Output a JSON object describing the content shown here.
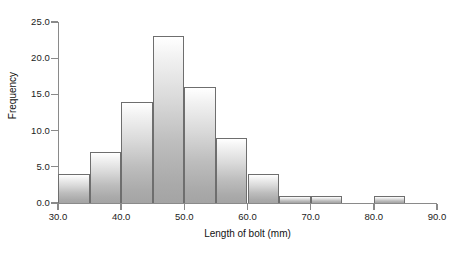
{
  "chart_data": {
    "type": "bar",
    "title": "",
    "subtitle": "",
    "xlabel": "Length of bolt (mm)",
    "ylabel": "Frequency",
    "xlim": [
      30,
      90
    ],
    "ylim": [
      0,
      25
    ],
    "grid": false,
    "legend": "none",
    "bin_width": 5,
    "bin_edges": [
      30,
      35,
      40,
      45,
      50,
      55,
      60,
      65,
      70,
      75,
      80,
      85,
      90
    ],
    "categories": [
      "30-35",
      "35-40",
      "40-45",
      "45-50",
      "50-55",
      "55-60",
      "60-65",
      "65-70",
      "70-75",
      "75-80",
      "80-85",
      "85-90"
    ],
    "values": [
      4,
      7,
      14,
      23,
      16,
      9,
      4,
      1,
      1,
      0,
      1,
      0
    ],
    "x_ticks": [
      30,
      40,
      50,
      60,
      70,
      80,
      90
    ],
    "x_tick_labels": [
      "30.0",
      "40.0",
      "50.0",
      "60.0",
      "70.0",
      "80.0",
      "90.0"
    ],
    "y_ticks": [
      0,
      5,
      10,
      15,
      20,
      25
    ],
    "y_tick_labels": [
      "0.0",
      "5.0",
      "10.0",
      "15.0",
      "20.0",
      "25.0"
    ],
    "colors": {
      "bar_fill_top": "#ffffff",
      "bar_fill_bottom": "#a4a4a4",
      "bar_border": "#6e6e6e",
      "axis": "#8a8a8a",
      "text": "#1b1b1b",
      "background": "#ffffff"
    }
  }
}
